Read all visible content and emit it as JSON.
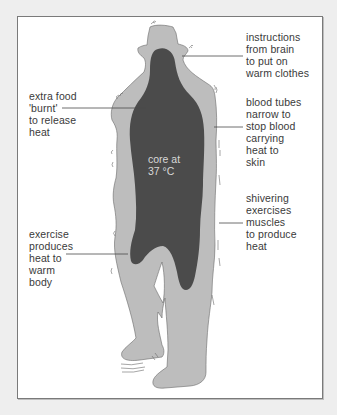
{
  "diagram": {
    "colors": {
      "background": "#eeeeee",
      "frame": "#ffffff",
      "body_shell": "#bdbdbd",
      "core": "#4b4b4b",
      "text": "#3a3a3a",
      "core_text": "#d8d8d8"
    },
    "core_label": "core at\n37 °C",
    "annotations": [
      {
        "id": "brain",
        "side": "right",
        "text": "instructions\nfrom brain\nto put on\nwarm clothes"
      },
      {
        "id": "food",
        "side": "left",
        "text": "extra food\n'burnt'\nto release\nheat"
      },
      {
        "id": "blood",
        "side": "right",
        "text": "blood tubes\nnarrow to\nstop blood\ncarrying\nheat to\nskin"
      },
      {
        "id": "shivering",
        "side": "right",
        "text": "shivering\nexercises\nmuscles\nto produce\nheat"
      },
      {
        "id": "exercise",
        "side": "left",
        "text": "exercise\nproduces\nheat to\nwarm\nbody"
      }
    ]
  }
}
